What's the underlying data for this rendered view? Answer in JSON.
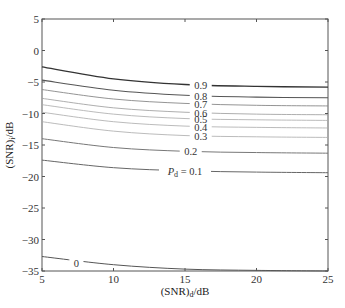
{
  "chart_data": {
    "type": "line",
    "title": "",
    "xlabel": "(SNR)_d/dB",
    "xlabel_main": "(SNR)",
    "xlabel_sub": "d",
    "xlabel_tail": "/dB",
    "ylabel": "(SNR)_i/dB",
    "ylabel_main": "(SNR)",
    "ylabel_sub": "i",
    "ylabel_tail": "/dB",
    "xlim": [
      5,
      25
    ],
    "ylim": [
      -35,
      5
    ],
    "xticks": [
      5,
      10,
      15,
      20,
      25
    ],
    "yticks": [
      5,
      0,
      -5,
      -10,
      -15,
      -20,
      -25,
      -30,
      -35
    ],
    "grid": false,
    "legend": "none (inline contour labels)",
    "x": [
      5,
      10,
      15,
      20,
      25
    ],
    "series": [
      {
        "name": "0.9",
        "label": "0.9",
        "values": [
          -2.6,
          -4.5,
          -5.4,
          -5.7,
          -5.8
        ],
        "color": "#333333",
        "width": 1.3
      },
      {
        "name": "0.8",
        "label": "0.8",
        "values": [
          -4.7,
          -6.3,
          -7.1,
          -7.4,
          -7.5
        ],
        "color": "#555555",
        "width": 1.1
      },
      {
        "name": "0.7",
        "label": "0.7",
        "values": [
          -6.2,
          -7.7,
          -8.4,
          -8.7,
          -8.8
        ],
        "color": "#888888",
        "width": 0.9
      },
      {
        "name": "0.6",
        "label": "0.6",
        "values": [
          -7.6,
          -9.1,
          -9.8,
          -10.1,
          -10.2
        ],
        "color": "#999999",
        "width": 0.8
      },
      {
        "name": "0.5",
        "label": "0.5",
        "values": [
          -8.6,
          -10.1,
          -10.8,
          -11.0,
          -11.1
        ],
        "color": "#aaaaaa",
        "width": 0.8
      },
      {
        "name": "0.4",
        "label": "0.4",
        "values": [
          -9.8,
          -11.3,
          -12.0,
          -12.2,
          -12.3
        ],
        "color": "#aaaaaa",
        "width": 0.8
      },
      {
        "name": "0.3",
        "label": "0.3",
        "values": [
          -11.3,
          -12.8,
          -13.5,
          -13.7,
          -13.8
        ],
        "color": "#aaaaaa",
        "width": 0.8
      },
      {
        "name": "0.2",
        "label": "0.2",
        "values": [
          -14.0,
          -15.4,
          -16.0,
          -16.2,
          -16.3
        ],
        "color": "#777777",
        "width": 1.0
      },
      {
        "name": "0.1",
        "label": "P_d = 0.1",
        "values": [
          -17.4,
          -18.6,
          -19.1,
          -19.3,
          -19.4
        ],
        "color": "#666666",
        "width": 1.0
      },
      {
        "name": "0",
        "label": "0",
        "values": [
          -32.7,
          -34.0,
          -34.7,
          -34.9,
          -35.0
        ],
        "color": "#555555",
        "width": 1.0
      }
    ],
    "label_positions": {
      "0.9": {
        "x": 16.1,
        "y": -5.5
      },
      "0.8": {
        "x": 16.1,
        "y": -7.2
      },
      "0.7": {
        "x": 16.1,
        "y": -8.5
      },
      "0.6": {
        "x": 16.1,
        "y": -9.9
      },
      "0.5": {
        "x": 16.1,
        "y": -10.95
      },
      "0.4": {
        "x": 16.1,
        "y": -12.1
      },
      "0.3": {
        "x": 16.1,
        "y": -13.6
      },
      "0.2": {
        "x": 15.4,
        "y": -16.0
      },
      "0.1": {
        "x": 15.0,
        "y": -19.2
      },
      "0": {
        "x": 7.4,
        "y": -33.8
      }
    },
    "pd_label_prefix": "P",
    "pd_label_sub": "d",
    "pd_label_suffix": " = 0.1"
  }
}
